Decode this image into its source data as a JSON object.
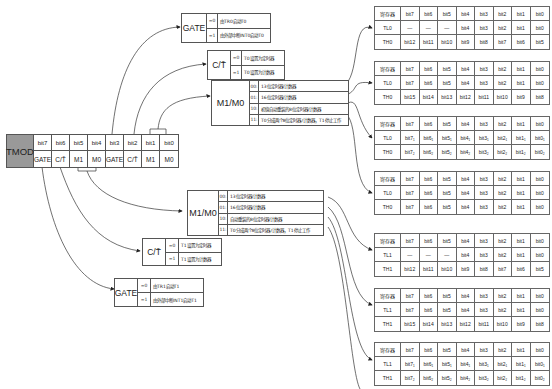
{
  "tmod": {
    "name": "TMOD",
    "bits": [
      "bit7",
      "bit6",
      "bit5",
      "bit4",
      "bit3",
      "bit2",
      "bit1",
      "bit0"
    ],
    "fields": [
      "GATE",
      "C/T̄",
      "M1",
      "M0",
      "GATE",
      "C/T̄",
      "M1",
      "M0"
    ]
  },
  "t0": {
    "gate": {
      "label": "GATE",
      "rows": [
        {
          "code": "=0",
          "desc": "由TR0启动T0"
        },
        {
          "code": "=1",
          "desc": "由外部中断INT0启动T0"
        }
      ]
    },
    "ct": {
      "label": "C/T̄",
      "rows": [
        {
          "code": "=0",
          "desc": "T0设置为定时器"
        },
        {
          "code": "=1",
          "desc": "T0设置为计数器"
        }
      ]
    },
    "mode": {
      "label": "M1/M0",
      "rows": [
        {
          "code": "00:",
          "desc": "13位定时器/计数器"
        },
        {
          "code": "01:",
          "desc": "16位定时器/计数器"
        },
        {
          "code": "10:",
          "desc": "初值自动重装的8位定时器/计数器"
        },
        {
          "code": "11:",
          "desc": "T0分成两个8位定时器/计数器，T1停止工作"
        }
      ]
    }
  },
  "t1": {
    "mode": {
      "label": "M1/M0",
      "rows": [
        {
          "code": "00:",
          "desc": "13位定时器/计数器"
        },
        {
          "code": "01:",
          "desc": "16位定时器/计数器"
        },
        {
          "code": "10:",
          "desc": "自动重装的8位定时器/计数器"
        },
        {
          "code": "11:",
          "desc": "T0分成两个8位定时器/计数器，T1停止工作"
        }
      ]
    },
    "ct": {
      "label": "C/T̄",
      "rows": [
        {
          "code": "=0",
          "desc": "T1设置为定时器"
        },
        {
          "code": "=1",
          "desc": "T1设置为计数器"
        }
      ]
    },
    "gate": {
      "label": "GATE",
      "rows": [
        {
          "code": "=0",
          "desc": "由TR1启动T1"
        },
        {
          "code": "=1",
          "desc": "由外部中断INT1启动T1"
        }
      ]
    }
  },
  "tables": [
    {
      "rows": [
        [
          "寄存器",
          "bit7",
          "bit6",
          "bit5",
          "bit4",
          "bit3",
          "bit2",
          "bit1",
          "bit0"
        ],
        [
          "TL0",
          "—",
          "—",
          "—",
          "bit4",
          "bit3",
          "bit2",
          "bit1",
          "bit0"
        ],
        [
          "TH0",
          "bit12",
          "bit11",
          "bit10",
          "bit9",
          "bit8",
          "bit7",
          "bit6",
          "bit5"
        ]
      ]
    },
    {
      "rows": [
        [
          "寄存器",
          "bit7",
          "bit6",
          "bit5",
          "bit4",
          "bit3",
          "bit2",
          "bit1",
          "bit0"
        ],
        [
          "TL0",
          "bit7",
          "bit6",
          "bit5",
          "bit4",
          "bit3",
          "bit2",
          "bit1",
          "bit0"
        ],
        [
          "TH0",
          "bit15",
          "bit14",
          "bit13",
          "bit12",
          "bit11",
          "bit10",
          "bit9",
          "bit8"
        ]
      ]
    },
    {
      "rows": [
        [
          "寄存器",
          "bit7",
          "bit6",
          "bit5",
          "bit4",
          "bit3",
          "bit2",
          "bit1",
          "bit0"
        ],
        [
          "TL0",
          "bit7₁",
          "bit6₁",
          "bit5₁",
          "bit4₁",
          "bit3₁",
          "bit2₁",
          "bit1₁",
          "bit0₁"
        ],
        [
          "TH0",
          "bit7₂",
          "bit6₂",
          "bit5₂",
          "bit4₂",
          "bit3₂",
          "bit2₂",
          "bit1₂",
          "bit0₂"
        ]
      ]
    },
    {
      "rows": [
        [
          "寄存器",
          "bit7",
          "bit6",
          "bit5",
          "bit4",
          "bit3",
          "bit2",
          "bit1",
          "bit0"
        ],
        [
          "TL0",
          "bit7",
          "bit6",
          "bit5",
          "bit4",
          "bit3",
          "bit2",
          "bit1",
          "bit0"
        ],
        [
          "TH0",
          "bit7",
          "bit6",
          "bit5",
          "bit4",
          "bit3",
          "bit2",
          "bit1",
          "bit0"
        ]
      ]
    },
    {
      "rows": [
        [
          "寄存器",
          "bit7",
          "bit6",
          "bit5",
          "bit4",
          "bit3",
          "bit2",
          "bit1",
          "bit0"
        ],
        [
          "TL1",
          "—",
          "—",
          "—",
          "bit4",
          "bit3",
          "bit2",
          "bit1",
          "bit0"
        ],
        [
          "TH1",
          "bit12",
          "bit11",
          "bit10",
          "bit9",
          "bit8",
          "bit7",
          "bit6",
          "bit5"
        ]
      ]
    },
    {
      "rows": [
        [
          "寄存器",
          "bit7",
          "bit6",
          "bit5",
          "bit4",
          "bit3",
          "bit2",
          "bit1",
          "bit0"
        ],
        [
          "TL1",
          "bit7",
          "bit6",
          "bit5",
          "bit4",
          "bit3",
          "bit2",
          "bit1",
          "bit0"
        ],
        [
          "TH1",
          "bit15",
          "bit14",
          "bit13",
          "bit12",
          "bit11",
          "bit10",
          "bit9",
          "bit8"
        ]
      ]
    },
    {
      "rows": [
        [
          "寄存器",
          "bit7",
          "bit6",
          "bit5",
          "bit4",
          "bit3",
          "bit2",
          "bit1",
          "bit0"
        ],
        [
          "TL1",
          "bit7₁",
          "bit6₁",
          "bit5₁",
          "bit4₁",
          "bit3₁",
          "bit2₁",
          "bit1₁",
          "bit0₁"
        ],
        [
          "TH1",
          "bit7₂",
          "bit6₂",
          "bit5₂",
          "bit4₂",
          "bit3₂",
          "bit2₂",
          "bit1₂",
          "bit0₂"
        ]
      ]
    }
  ],
  "colors": {
    "tmod_name_bg": "#999999",
    "line": "#333333"
  }
}
